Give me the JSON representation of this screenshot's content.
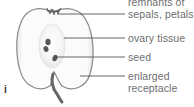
{
  "diagram": {
    "part_marker": "i",
    "labels": [
      {
        "id": "sepals",
        "line1": "remnants of",
        "line2": "sepals, petals"
      },
      {
        "id": "ovary",
        "line1": "ovary tissue"
      },
      {
        "id": "seed",
        "line1": "seed"
      },
      {
        "id": "receptacle",
        "line1": "enlarged",
        "line2": "receptacle"
      }
    ],
    "colors": {
      "outline": "#8a8a8a",
      "flesh": "#ffffff",
      "core_shade": "#f0f0f0",
      "seed": "#555555",
      "stalk": "#666666",
      "leader_line": "#555555",
      "label_text": "#6e6e6e"
    }
  }
}
